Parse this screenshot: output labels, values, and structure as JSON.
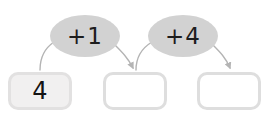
{
  "worksheet": {
    "title": "number-chain-worksheet",
    "background_color": "#ffffff"
  },
  "colors": {
    "bubble_fill": "#d2d2d2",
    "box_border": "#dedede",
    "box_fill_empty": "#ffffff",
    "box_fill_start": "#f1f0f0",
    "text": "#141414",
    "arrow": "#b4b4b4"
  },
  "boxes": [
    {
      "id": "box-1",
      "value": "4",
      "state": "filled",
      "x": 8,
      "y": 72
    },
    {
      "id": "box-2",
      "value": "",
      "state": "empty",
      "x": 103,
      "y": 72
    },
    {
      "id": "box-3",
      "value": "",
      "state": "empty",
      "x": 197,
      "y": 72
    }
  ],
  "operations": [
    {
      "id": "operation-1",
      "label": "+1",
      "x": 50,
      "y": 15,
      "width": 70,
      "height": 42
    },
    {
      "id": "operation-2",
      "label": "+4",
      "x": 148,
      "y": 15,
      "width": 70,
      "height": 42
    }
  ],
  "arrows": [
    {
      "id": "arrow-box1-to-op1",
      "from": "box-1",
      "to": "operation-1",
      "has_arrowhead": false
    },
    {
      "id": "arrow-op1-to-box2",
      "from": "operation-1",
      "to": "box-2",
      "has_arrowhead": true
    },
    {
      "id": "arrow-box2-to-op2",
      "from": "box-2",
      "to": "operation-2",
      "has_arrowhead": false
    },
    {
      "id": "arrow-op2-to-box3",
      "from": "operation-2",
      "to": "box-3",
      "has_arrowhead": true
    }
  ]
}
